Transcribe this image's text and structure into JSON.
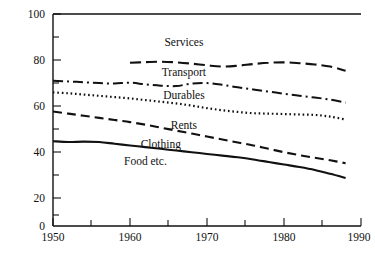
{
  "chart_data": {
    "type": "line",
    "title": "",
    "subtitle": "",
    "xlabel": "",
    "ylabel": "",
    "xlim": [
      1950,
      1990
    ],
    "ylim": [
      0,
      100
    ],
    "grid": false,
    "legend_position": "inline-labels",
    "x_ticks_major": [
      1950,
      1960,
      1970,
      1980,
      1990
    ],
    "x_ticks_minor": [
      1955,
      1965,
      1975,
      1985
    ],
    "y_ticks_major": [
      0,
      20,
      40,
      60,
      80,
      100
    ],
    "y_ticks_minor": [
      10,
      30,
      50,
      70,
      90
    ],
    "x_tick_labels": [
      "1950",
      "1960",
      "1970",
      "1980",
      "1990"
    ],
    "y_tick_labels": [
      "0",
      "20",
      "40",
      "60",
      "80",
      "100"
    ],
    "series": [
      {
        "name": "Services",
        "label": "Services",
        "linestyle": "long-dash",
        "dasharray": "11,5",
        "linewidth": 2.1,
        "label_x": 1967,
        "label_y": 85,
        "x": [
          1960,
          1962,
          1964,
          1966,
          1968,
          1970,
          1972,
          1974,
          1976,
          1978,
          1980,
          1982,
          1984,
          1986,
          1988
        ],
        "y": [
          77.0,
          77.3,
          77.5,
          77.2,
          76.6,
          75.8,
          75.2,
          75.6,
          76.4,
          77.0,
          77.2,
          76.8,
          76.2,
          75.2,
          73.2
        ]
      },
      {
        "name": "Transport",
        "label": "Transport",
        "linestyle": "dash-dot",
        "dasharray": "10,4,2,4",
        "linewidth": 2.0,
        "label_x": 1967,
        "label_y": 71,
        "x": [
          1950,
          1952,
          1954,
          1956,
          1958,
          1960,
          1962,
          1964,
          1966,
          1968,
          1970,
          1972,
          1974,
          1976,
          1978,
          1980,
          1982,
          1984,
          1986,
          1988
        ],
        "y": [
          68.5,
          68.2,
          67.8,
          67.4,
          67.2,
          67.6,
          66.8,
          66.2,
          66.0,
          67.2,
          67.4,
          66.6,
          65.4,
          64.4,
          63.4,
          62.4,
          61.4,
          60.6,
          59.6,
          58.2
        ]
      },
      {
        "name": "Durables",
        "label": "Durables",
        "linestyle": "dotted",
        "dasharray": "1.6,2.8",
        "linewidth": 2.2,
        "label_x": 1967,
        "label_y": 60,
        "x": [
          1950,
          1952,
          1954,
          1956,
          1958,
          1960,
          1962,
          1964,
          1966,
          1968,
          1970,
          1972,
          1974,
          1976,
          1978,
          1980,
          1982,
          1984,
          1986,
          1988
        ],
        "y": [
          63.0,
          62.6,
          62.0,
          61.4,
          60.8,
          60.2,
          59.4,
          58.6,
          57.8,
          56.8,
          55.6,
          54.6,
          53.8,
          53.2,
          53.0,
          52.8,
          52.6,
          52.4,
          51.6,
          50.2
        ]
      },
      {
        "name": "Rents",
        "label": "Rents",
        "linestyle": "medium-dash",
        "dasharray": "9,5",
        "linewidth": 2.1,
        "label_x": 1967,
        "label_y": 46,
        "x": [
          1950,
          1952,
          1954,
          1956,
          1958,
          1960,
          1962,
          1964,
          1966,
          1968,
          1970,
          1972,
          1974,
          1976,
          1978,
          1980,
          1982,
          1984,
          1986,
          1988
        ],
        "y": [
          54.0,
          53.0,
          52.0,
          51.0,
          50.0,
          49.0,
          47.8,
          46.4,
          45.0,
          43.6,
          42.2,
          40.8,
          39.4,
          38.0,
          36.4,
          34.8,
          33.4,
          32.2,
          31.0,
          29.6
        ]
      },
      {
        "name": "Clothing",
        "label": "Clothing",
        "linestyle": "solid",
        "dasharray": "",
        "linewidth": 2.1,
        "label_x": 1964,
        "label_y": 37,
        "x": [
          1950,
          1952,
          1954,
          1956,
          1958,
          1960,
          1962,
          1964,
          1966,
          1968,
          1970,
          1972,
          1974,
          1976,
          1978,
          1980,
          1982,
          1984,
          1986,
          1988
        ],
        "y": [
          40.0,
          39.6,
          39.8,
          39.6,
          38.8,
          38.0,
          37.2,
          36.4,
          35.6,
          34.8,
          34.0,
          33.2,
          32.4,
          31.4,
          30.2,
          29.0,
          27.8,
          26.4,
          24.6,
          22.6
        ]
      },
      {
        "name": "Food etc.",
        "label": "Food etc.",
        "linestyle": "solid-lower",
        "dasharray": "",
        "linewidth": 2.1,
        "label_x": 1962,
        "label_y": 29,
        "x": [],
        "y": []
      }
    ]
  },
  "axes": {
    "top_rule": true,
    "left_axis": true,
    "bottom_axis": true,
    "right_axis": false
  }
}
